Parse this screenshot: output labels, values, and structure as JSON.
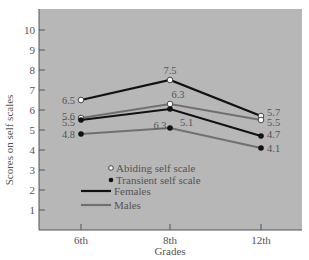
{
  "chart_data": {
    "type": "line",
    "title": "",
    "xlabel": "Grades",
    "ylabel": "Scores on self scales",
    "categories": [
      "6th",
      "8th",
      "12th"
    ],
    "ylim": [
      0,
      10
    ],
    "yticks": [
      1,
      2,
      3,
      4,
      5,
      6,
      7,
      8,
      9,
      10
    ],
    "grid": false,
    "legend_position": "lower-left inside plot",
    "legend": {
      "markers": [
        {
          "label": "Abiding self scale",
          "marker": "open-circle"
        },
        {
          "label": "Transient self scale",
          "marker": "filled-circle"
        }
      ],
      "lines": [
        {
          "label": "Females",
          "color": "#111111"
        },
        {
          "label": "Males",
          "color": "#707070"
        }
      ]
    },
    "series": [
      {
        "name": "Females - Abiding self scale",
        "gender": "Females",
        "scale": "Abiding",
        "marker": "open",
        "color": "#111111",
        "values": [
          6.5,
          7.5,
          5.7
        ],
        "labels": [
          "6.5",
          "7.5",
          "5.7"
        ]
      },
      {
        "name": "Males - Abiding self scale",
        "gender": "Males",
        "scale": "Abiding",
        "marker": "open",
        "color": "#707070",
        "values": [
          5.6,
          6.3,
          5.5
        ],
        "labels": [
          "5.6",
          "6.3",
          "5.5"
        ]
      },
      {
        "name": "Females - Transient self scale",
        "gender": "Females",
        "scale": "Transient",
        "marker": "filled",
        "color": "#111111",
        "values": [
          5.5,
          6.05,
          4.7
        ],
        "labels": [
          "5.5",
          "6.3",
          "4.7"
        ]
      },
      {
        "name": "Males - Transient self scale",
        "gender": "Males",
        "scale": "Transient",
        "marker": "filled",
        "color": "#707070",
        "values": [
          4.8,
          5.1,
          4.1
        ],
        "labels": [
          "4.8",
          "5.1",
          "4.1"
        ]
      }
    ]
  },
  "colors": {
    "plot_background": "#b7b7b7",
    "axis": "#555555",
    "text": "#555555"
  }
}
